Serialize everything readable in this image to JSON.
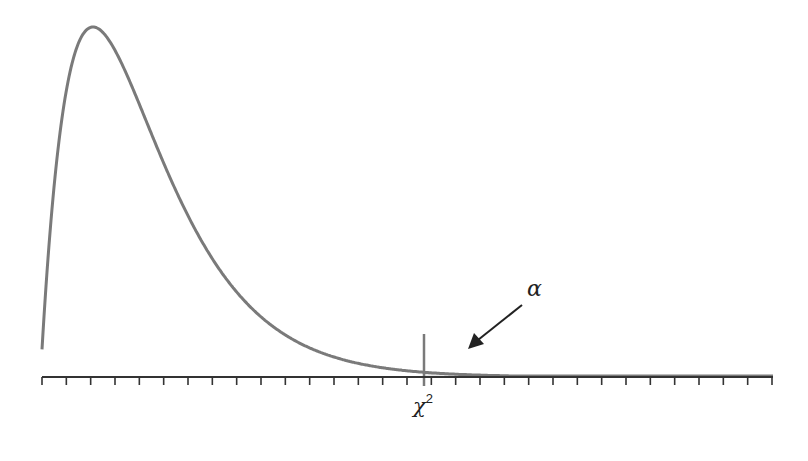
{
  "chart_data": {
    "type": "area",
    "title": "",
    "xlabel": "",
    "ylabel": "",
    "critical_value_label": "χ",
    "critical_value_superscript": "2",
    "tail_area_label": "α",
    "axis": {
      "tick_count": 31,
      "tick_labels": [],
      "grid": false
    },
    "curve": {
      "shape": "chi-square density, right skewed",
      "peak_x_px": 93,
      "peak_y_px": 27,
      "left_start_y_px": 322,
      "critical_x_px": 424,
      "critical_y_px": 344
    },
    "shaded_region": "right tail beyond critical value",
    "colors": {
      "curve": "#7a7a7a",
      "axis": "#333333",
      "shade": "#e6e6e6",
      "arrow": "#222222"
    }
  },
  "labels": {
    "alpha": "α",
    "chi": "χ",
    "chi_sup": "2"
  }
}
